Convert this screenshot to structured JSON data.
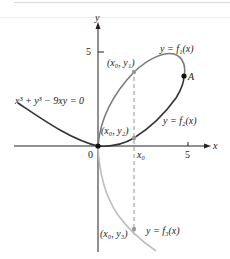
{
  "figure": {
    "equation": "x³ + y³ − 9xy = 0",
    "axes": {
      "x_label": "x",
      "y_label": "y",
      "origin_label": "0",
      "x_tick_label": "5",
      "y_tick_label": "5",
      "x0_label": "x₀"
    },
    "curves": [
      {
        "name": "f1",
        "label": "y = f₁(x)",
        "color": "#7a7a7a"
      },
      {
        "name": "f2",
        "label": "y = f₂(x)",
        "color": "#333333"
      },
      {
        "name": "f3",
        "label": "y = f₃(x)",
        "color": "#bdbdbd"
      }
    ],
    "points": [
      {
        "name": "x0-y1",
        "label": "(x₀, y₁)"
      },
      {
        "name": "x0-y2",
        "label": "(x₀, y₂)"
      },
      {
        "name": "x0-y3",
        "label": "(x₀, y₃)"
      },
      {
        "name": "A",
        "label": "A"
      }
    ]
  }
}
